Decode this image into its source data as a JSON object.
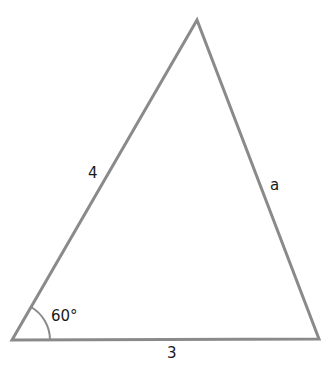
{
  "diagram": {
    "type": "triangle",
    "stroke_color": "#8a8a8a",
    "text_color": "#1a1a1a",
    "vertices": {
      "bottom_left": [
        12,
        340
      ],
      "top": [
        197,
        20
      ],
      "bottom_right": [
        319,
        339
      ]
    },
    "labels": {
      "left_side": "4",
      "right_side": "a",
      "base": "3",
      "angle": "60°"
    }
  }
}
